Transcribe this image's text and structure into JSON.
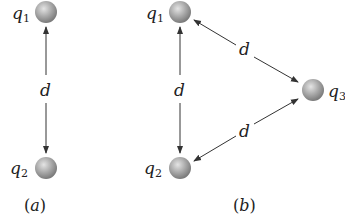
{
  "figure": {
    "panel_a": {
      "caption_open": "(",
      "caption_letter": "a",
      "caption_close": ")",
      "charges": [
        {
          "name": "q",
          "sub": "1"
        },
        {
          "name": "q",
          "sub": "2"
        }
      ],
      "distance_label": "d"
    },
    "panel_b": {
      "caption_open": "(",
      "caption_letter": "b",
      "caption_close": ")",
      "charges": [
        {
          "name": "q",
          "sub": "1"
        },
        {
          "name": "q",
          "sub": "2"
        },
        {
          "name": "q",
          "sub": "3"
        }
      ],
      "distance_labels": [
        "d",
        "d",
        "d"
      ]
    },
    "colors": {
      "sphere": "#a8a8a8",
      "arrow": "#333333",
      "text": "#222222"
    }
  }
}
